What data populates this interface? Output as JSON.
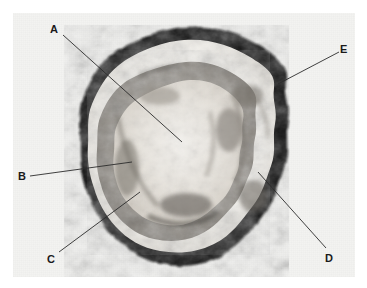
{
  "figure": {
    "kind": "photomicrograph-cross-section",
    "background_color": "#ffffff",
    "plate_color": "#f3f3f1",
    "plate": {
      "x": 13,
      "y": 13,
      "width": 342,
      "height": 264
    }
  },
  "specimen": {
    "name": "cross-section-specimen",
    "description_visible": "",
    "rind_color": "#111111",
    "cortex_color": "#f2f0ec",
    "medulla_color": "#9a968f",
    "core_color": "#e8e5df",
    "center": {
      "cx": 184,
      "cy": 146
    },
    "outer_radius_x": 102,
    "outer_radius_y": 119
  },
  "callouts": [
    {
      "id": "A",
      "label": "A",
      "label_x": 50,
      "label_y": 24,
      "line_start": {
        "x": 63,
        "y": 35
      },
      "line_end": {
        "x": 182,
        "y": 142
      }
    },
    {
      "id": "B",
      "label": "B",
      "label_x": 18,
      "label_y": 171,
      "line_start": {
        "x": 30,
        "y": 176
      },
      "line_end": {
        "x": 132,
        "y": 162
      }
    },
    {
      "id": "C",
      "label": "C",
      "label_x": 47,
      "label_y": 254,
      "line_start": {
        "x": 59,
        "y": 252
      },
      "line_end": {
        "x": 140,
        "y": 192
      }
    },
    {
      "id": "D",
      "label": "D",
      "label_x": 325,
      "label_y": 253,
      "line_start": {
        "x": 326,
        "y": 248
      },
      "line_end": {
        "x": 258,
        "y": 172
      }
    },
    {
      "id": "E",
      "label": "E",
      "label_x": 340,
      "label_y": 44,
      "line_start": {
        "x": 339,
        "y": 52
      },
      "line_end": {
        "x": 278,
        "y": 84
      }
    }
  ]
}
